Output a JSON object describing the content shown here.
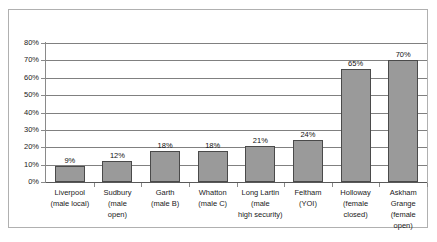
{
  "chart_data": {
    "type": "bar",
    "title": "",
    "subtitle": "",
    "xlabel": "",
    "ylabel": "",
    "ylim": [
      0,
      80
    ],
    "ytick_step": 10,
    "grid": "horizontal",
    "legend": "none",
    "value_suffix": "%",
    "bar_color": "#9a9a9a",
    "bar_border_color": "#4a4a4a",
    "plot_border_color": "#b0b0b0",
    "gridline_color": "#808080",
    "categories": [
      "Liverpool\n(male local)",
      "Sudbury\n(male\nopen)",
      "Garth\n(male B)",
      "Whatton\n(male C)",
      "Long Lartin\n(male\nhigh security)",
      "Feltham\n(YOI)",
      "Holloway\n(female\nclosed)",
      "Askham\nGrange\n(female\nopen)"
    ],
    "values": [
      9,
      12,
      18,
      18,
      21,
      24,
      65,
      70
    ],
    "value_labels": [
      "9%",
      "12%",
      "18%",
      "18%",
      "21%",
      "24%",
      "65%",
      "70%"
    ],
    "ytick_labels": [
      "0%",
      "10%",
      "20%",
      "30%",
      "40%",
      "50%",
      "60%",
      "70%",
      "80%"
    ],
    "ytick_values": [
      0,
      10,
      20,
      30,
      40,
      50,
      60,
      70,
      80
    ]
  }
}
